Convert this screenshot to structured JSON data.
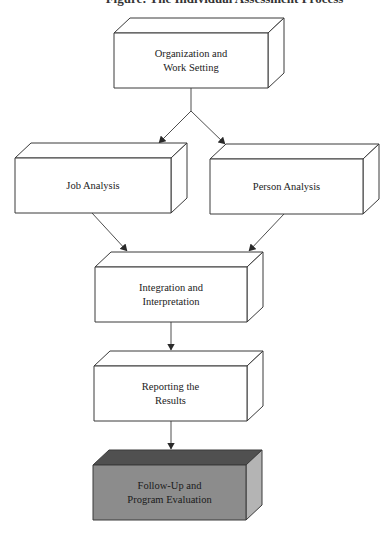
{
  "title": "Figure: The Individual Assessment Process",
  "colors": {
    "stroke": "#3a3a3a",
    "face_front": "#ffffff",
    "face_top": "#ffffff",
    "face_side": "#ffffff",
    "highlight_front": "#8c8c8c",
    "highlight_top": "#505050",
    "highlight_side": "#b4b4b4"
  },
  "nodes": [
    {
      "id": "organization",
      "lines": [
        "Organization and",
        "Work Setting"
      ],
      "front": {
        "x": 114,
        "y": 33,
        "w": 154,
        "h": 55
      },
      "highlight": false
    },
    {
      "id": "job-analysis",
      "lines": [
        "Job Analysis"
      ],
      "front": {
        "x": 15,
        "y": 158,
        "w": 156,
        "h": 55
      },
      "highlight": false
    },
    {
      "id": "person-analysis",
      "lines": [
        "Person Analysis"
      ],
      "front": {
        "x": 210,
        "y": 159,
        "w": 153,
        "h": 55
      },
      "highlight": false
    },
    {
      "id": "integration",
      "lines": [
        "Integration and",
        "Interpretation"
      ],
      "front": {
        "x": 95,
        "y": 267,
        "w": 152,
        "h": 55
      },
      "highlight": false
    },
    {
      "id": "reporting",
      "lines": [
        "Reporting the",
        "Results"
      ],
      "front": {
        "x": 94,
        "y": 366,
        "w": 153,
        "h": 55
      },
      "highlight": false
    },
    {
      "id": "follow-up",
      "lines": [
        "Follow-Up and",
        "Program Evaluation"
      ],
      "front": {
        "x": 93,
        "y": 465,
        "w": 153,
        "h": 55
      },
      "highlight": true
    }
  ],
  "depth": {
    "dx": 16,
    "dy": -15
  },
  "edges": [
    {
      "from": "organization",
      "to": "job-analysis",
      "label": ""
    },
    {
      "from": "organization",
      "to": "person-analysis",
      "label": ""
    },
    {
      "from": "job-analysis",
      "to": "integration",
      "label": ""
    },
    {
      "from": "person-analysis",
      "to": "integration",
      "label": ""
    },
    {
      "from": "integration",
      "to": "reporting",
      "label": ""
    },
    {
      "from": "reporting",
      "to": "follow-up",
      "label": ""
    }
  ]
}
